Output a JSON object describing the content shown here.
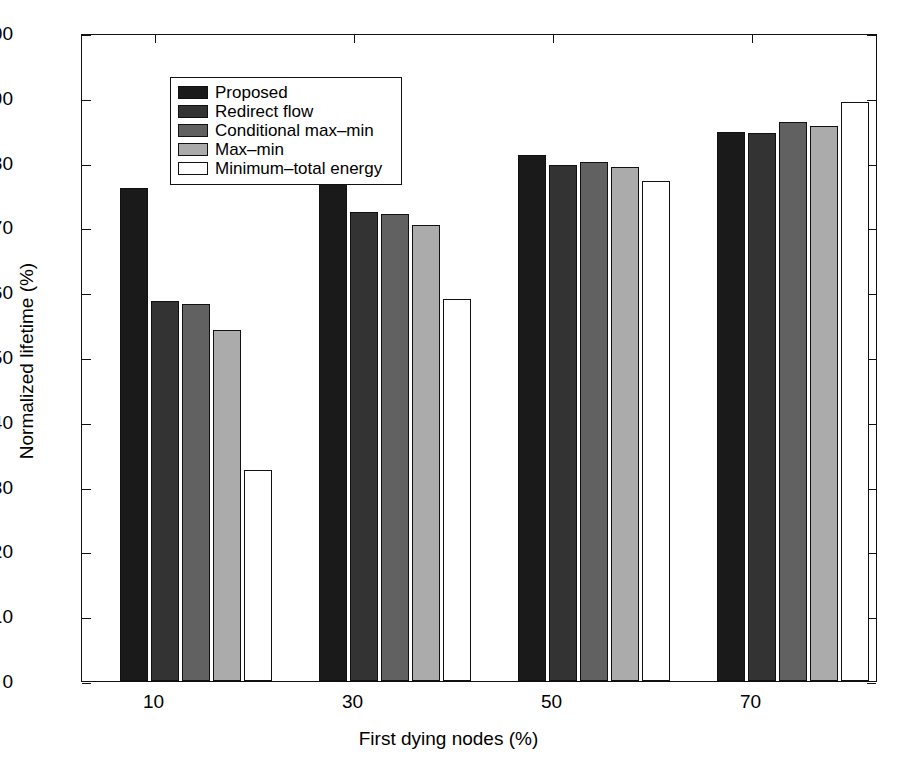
{
  "chart_data": {
    "type": "bar",
    "title": "",
    "xlabel": "First dying nodes (%)",
    "ylabel": "Normalized lifetime (%)",
    "categories": [
      "10",
      "30",
      "50",
      "70"
    ],
    "ylim": [
      0,
      100
    ],
    "yticks": [
      0,
      10,
      20,
      30,
      40,
      50,
      60,
      70,
      80,
      90,
      100
    ],
    "ytick_labels": [
      "0",
      "10",
      "20",
      "30",
      "40",
      "50",
      "60",
      "70",
      "80",
      "90",
      "100"
    ],
    "grid": false,
    "legend_position": "upper-left-inside",
    "series": [
      {
        "name": "Proposed",
        "color": "#1a1a1a",
        "values": [
          76.1,
          76.9,
          81.2,
          84.8
        ]
      },
      {
        "name": "Redirect flow",
        "color": "#333333",
        "values": [
          58.7,
          72.4,
          79.6,
          84.5
        ]
      },
      {
        "name": "Conditional max-min",
        "color": "#616161",
        "values": [
          58.2,
          72.0,
          80.1,
          86.2
        ]
      },
      {
        "name": "Max-min",
        "color": "#ababab",
        "values": [
          54.1,
          70.4,
          79.3,
          85.6
        ]
      },
      {
        "name": "Minimum-total energy",
        "color": "#ffffff",
        "values": [
          32.5,
          58.9,
          77.1,
          89.4
        ]
      }
    ]
  },
  "legend": {
    "items": [
      {
        "label": "Proposed"
      },
      {
        "label": "Redirect flow"
      },
      {
        "label": "Conditional max–min"
      },
      {
        "label": "Max–min"
      },
      {
        "label": "Minimum–total energy"
      }
    ]
  },
  "axes": {
    "x_title": "First dying nodes (%)",
    "y_title": "Normalized lifetime (%)"
  }
}
